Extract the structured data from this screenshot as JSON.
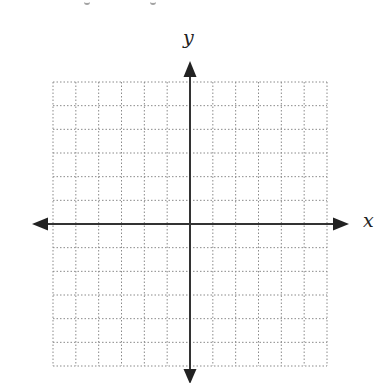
{
  "diagram": {
    "type": "coordinate-plane",
    "x_axis_label": "x",
    "y_axis_label": "y",
    "grid": {
      "cells_left": 6,
      "cells_right": 6,
      "cells_up": 6,
      "cells_down": 6,
      "style": "dotted",
      "grid_color": "#8a8a8a",
      "axis_color": "#333333"
    }
  }
}
